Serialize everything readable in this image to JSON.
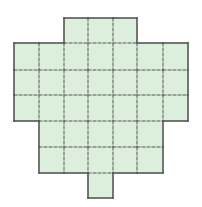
{
  "diagram": {
    "type": "grid-polyomino",
    "cell_size": 25,
    "colors": {
      "fill": "#dcefdc",
      "border": "#555555",
      "grid": "#555555",
      "background": "#ffffff"
    },
    "xs": [
      14,
      39,
      64,
      88,
      113,
      137,
      163,
      188
    ],
    "ys": [
      18,
      43,
      70,
      95,
      121,
      147,
      173,
      198
    ],
    "rows": [
      {
        "row": 0,
        "cols": [
          2,
          3,
          4
        ]
      },
      {
        "row": 1,
        "cols": [
          0,
          1,
          2,
          3,
          4,
          5,
          6
        ]
      },
      {
        "row": 2,
        "cols": [
          0,
          1,
          2,
          3,
          4,
          5,
          6
        ]
      },
      {
        "row": 3,
        "cols": [
          0,
          1,
          2,
          3,
          4,
          5,
          6
        ]
      },
      {
        "row": 4,
        "cols": [
          1,
          2,
          3,
          4,
          5
        ]
      },
      {
        "row": 5,
        "cols": [
          1,
          2,
          3,
          4,
          5
        ]
      },
      {
        "row": 6,
        "cols": [
          3
        ]
      }
    ],
    "total_cells": 40
  }
}
